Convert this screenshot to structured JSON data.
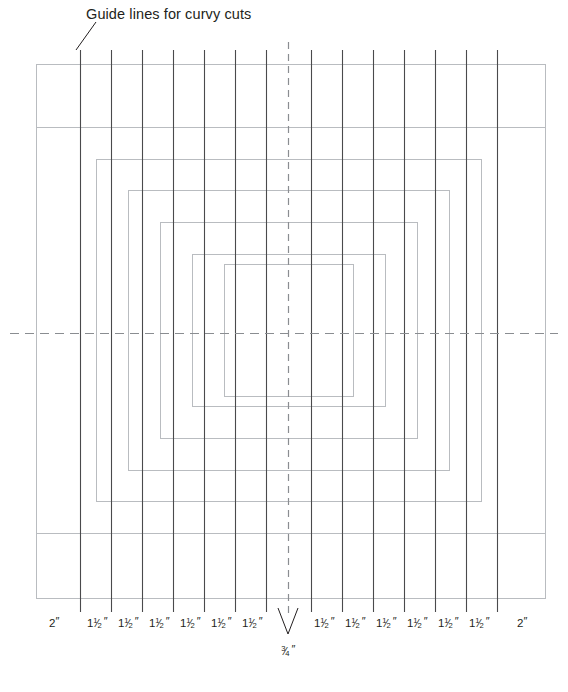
{
  "figure": {
    "title_annotation": "Guide lines for curvy cuts",
    "background_color": "#ffffff",
    "ink_color": "#231f20",
    "rect_color": "#b9bcc0",
    "guide_line_color": "#4a4a4c",
    "dash_color": "#8a8d91",
    "width": 568,
    "height": 692
  },
  "dimensions": {
    "outer": "2″",
    "strip": "1½″",
    "center": "¾″",
    "labels": [
      {
        "text": "2",
        "kind": "whole",
        "x": 54
      },
      {
        "text": "1 1/2",
        "kind": "frac",
        "x": 97
      },
      {
        "text": "1 1/2",
        "kind": "frac",
        "x": 128
      },
      {
        "text": "1 1/2",
        "kind": "frac",
        "x": 159
      },
      {
        "text": "1 1/2",
        "kind": "frac",
        "x": 190
      },
      {
        "text": "1 1/2",
        "kind": "frac",
        "x": 221
      },
      {
        "text": "1 1/2",
        "kind": "frac",
        "x": 252
      },
      {
        "text": "1 1/2",
        "kind": "frac",
        "x": 324
      },
      {
        "text": "1 1/2",
        "kind": "frac",
        "x": 355
      },
      {
        "text": "1 1/2",
        "kind": "frac",
        "x": 386
      },
      {
        "text": "1 1/2",
        "kind": "frac",
        "x": 417
      },
      {
        "text": "1 1/2",
        "kind": "frac",
        "x": 448
      },
      {
        "text": "1 1/2",
        "kind": "frac",
        "x": 479
      },
      {
        "text": "2",
        "kind": "whole",
        "x": 522
      }
    ],
    "center_label": {
      "numerator": "3",
      "denominator": "4",
      "prime": "″"
    }
  },
  "chart_data": {
    "type": "diagram",
    "title": "Guide lines for curvy cuts",
    "outer_rect": {
      "x": 36,
      "y": 64,
      "w": 509,
      "h": 534
    },
    "nested_rects": [
      {
        "x": 36,
        "y": 64,
        "w": 509,
        "h": 534
      },
      {
        "x": 36,
        "y": 127,
        "w": 509,
        "h": 406
      },
      {
        "x": 96,
        "y": 159,
        "w": 385,
        "h": 342
      },
      {
        "x": 128,
        "y": 190,
        "w": 321,
        "h": 280
      },
      {
        "x": 160,
        "y": 222,
        "w": 257,
        "h": 216
      },
      {
        "x": 192,
        "y": 254,
        "w": 193,
        "h": 152
      },
      {
        "x": 224,
        "y": 264,
        "w": 129,
        "h": 132
      }
    ],
    "guide_lines_x": [
      80,
      111,
      142,
      173,
      204,
      235,
      266,
      311,
      342,
      373,
      404,
      435,
      466,
      497
    ],
    "guide_line_top": 50,
    "guide_line_bottom": 612,
    "center_vertical_dash_x": 288,
    "center_horizontal_dash_y": 333,
    "center_horizontal_dash_span": [
      10,
      558
    ],
    "center_vertical_dash_span": [
      42,
      614
    ],
    "leader_line": {
      "x1": 76,
      "y1": 50,
      "x2": 96,
      "y2": 22
    },
    "caret": {
      "apex_x": 288,
      "apex_y": 634,
      "left_x": 278,
      "right_x": 298,
      "top_y": 608
    }
  }
}
